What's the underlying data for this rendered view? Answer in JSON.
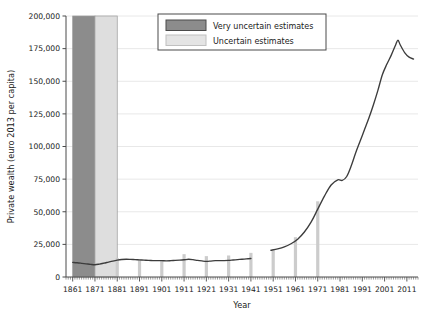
{
  "chart_data": {
    "type": "line",
    "title": "",
    "xlabel": "Year",
    "ylabel": "Private wealth (euro 2013 per capita)",
    "xlim": [
      1858,
      2016
    ],
    "ylim": [
      0,
      200000
    ],
    "grid": true,
    "legend_position": "top-center",
    "y_ticks": [
      0,
      25000,
      50000,
      75000,
      100000,
      125000,
      150000,
      175000,
      200000
    ],
    "y_tick_labels": [
      "0",
      "25,000",
      "50,000",
      "75,000",
      "100,000",
      "125,000",
      "150,000",
      "175,000",
      "200,000"
    ],
    "x_ticks": [
      1861,
      1871,
      1881,
      1891,
      1901,
      1911,
      1921,
      1931,
      1941,
      1951,
      1961,
      1971,
      1981,
      1991,
      2001,
      2011
    ],
    "x_tick_labels": [
      "1861",
      "1871",
      "1881",
      "1891",
      "1901",
      "1911",
      "1921",
      "1931",
      "1941",
      "1951",
      "1961",
      "1971",
      "1981",
      "1991",
      "2001",
      "2011"
    ],
    "series": [
      {
        "name": "Private wealth",
        "color": "#3c3c3c",
        "segments": [
          {
            "name": "early-period",
            "x": [
              1861,
              1863,
              1865,
              1867,
              1869,
              1871,
              1873,
              1875,
              1877,
              1879,
              1881,
              1883,
              1885,
              1887,
              1889,
              1891,
              1893,
              1895,
              1897,
              1899,
              1901,
              1903,
              1905,
              1907,
              1909,
              1911,
              1913,
              1915,
              1917,
              1919,
              1921,
              1923,
              1925,
              1927,
              1929,
              1931,
              1933,
              1935,
              1937,
              1939,
              1941
            ],
            "y": [
              11200,
              10900,
              10500,
              10100,
              9700,
              9400,
              9900,
              10600,
              11400,
              12200,
              12900,
              13400,
              13600,
              13500,
              13300,
              13100,
              12900,
              12700,
              12600,
              12500,
              12500,
              12400,
              12500,
              12700,
              12900,
              13200,
              13600,
              13300,
              12700,
              12300,
              12000,
              12200,
              12500,
              12600,
              12600,
              12700,
              13000,
              13300,
              13600,
              13900,
              14200
            ]
          },
          {
            "name": "modern-period",
            "x": [
              1950,
              1953,
              1956,
              1959,
              1962,
              1965,
              1968,
              1971,
              1974,
              1977,
              1980,
              1982,
              1984,
              1986,
              1988,
              1990,
              1992,
              1994,
              1996,
              1998,
              2000,
              2002,
              2004,
              2006,
              2007,
              2008,
              2010,
              2012,
              2014
            ],
            "y": [
              20500,
              21500,
              23000,
              25500,
              29000,
              34500,
              42000,
              52000,
              62000,
              70500,
              74500,
              74000,
              77000,
              85000,
              95000,
              104000,
              113000,
              122000,
              132000,
              143000,
              155000,
              163000,
              170000,
              178000,
              181500,
              178000,
              172000,
              168500,
              167000
            ]
          }
        ]
      }
    ],
    "shaded_bands": [
      {
        "name": "very-uncertain-band",
        "x_start": 1861,
        "x_end": 1871,
        "color": "#8c8c8c",
        "label": "Very uncertain estimates"
      },
      {
        "name": "uncertain-band",
        "x_start": 1871,
        "x_end": 1881,
        "color": "#dedede",
        "label": "Uncertain estimates"
      }
    ],
    "uncertainty_bars": [
      {
        "x": 1881,
        "top": 14500,
        "bottom": 0
      },
      {
        "x": 1891,
        "top": 13200,
        "bottom": 0
      },
      {
        "x": 1901,
        "top": 12600,
        "bottom": 0
      },
      {
        "x": 1911,
        "top": 17500,
        "bottom": 0
      },
      {
        "x": 1921,
        "top": 16000,
        "bottom": 0
      },
      {
        "x": 1931,
        "top": 16500,
        "bottom": 0
      },
      {
        "x": 1941,
        "top": 18500,
        "bottom": 0
      },
      {
        "x": 1951,
        "top": 20500,
        "bottom": 0
      },
      {
        "x": 1961,
        "top": 30500,
        "bottom": 0
      },
      {
        "x": 1971,
        "top": 58000,
        "bottom": 0
      }
    ],
    "annotations": {
      "data_gap": {
        "from": 1941,
        "to": 1950
      }
    }
  },
  "legend": {
    "items": [
      {
        "label": "Very uncertain estimates",
        "swatch_color": "#8c8c8c",
        "swatch_border": "#4a4a4a"
      },
      {
        "label": "Uncertain estimates",
        "swatch_color": "#e4e4e4",
        "swatch_border": "#c0c0c0"
      }
    ],
    "border_color": "#4a4a4a",
    "background": "#ffffff"
  },
  "style": {
    "grid_color": "#e8e8e8",
    "axis_color": "#4a4a4a",
    "line_color": "#3c3c3c",
    "bar_color": "#cccccc",
    "plot_background": "#ffffff"
  }
}
